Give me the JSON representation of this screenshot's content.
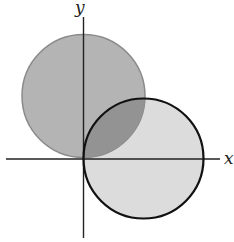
{
  "diagram": {
    "axes": {
      "x_label": "x",
      "y_label": "y"
    },
    "circles": [
      {
        "name": "upper-circle",
        "fill": "#b4b4b4",
        "stroke": "#8a8a8a",
        "cx": 83.5,
        "cy": 96,
        "r": 61.5
      },
      {
        "name": "lower-circle",
        "fill": "#dcdcdc",
        "stroke": "#111111",
        "cx": 143.5,
        "cy": 158.5,
        "r": 60
      }
    ],
    "overlap_fill": "#8f8f8f"
  }
}
